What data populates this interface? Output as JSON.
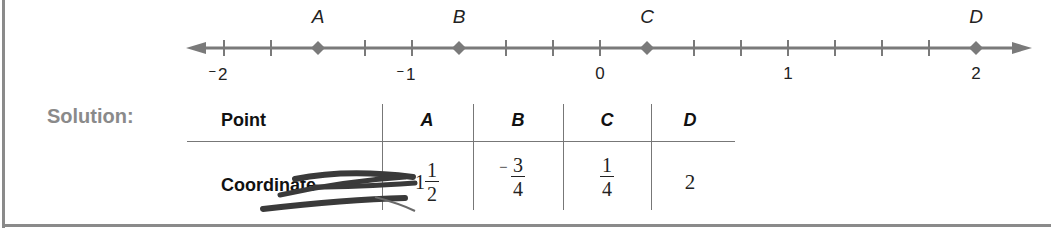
{
  "number_line": {
    "min": -2,
    "max": 2,
    "tick_step": 0.25,
    "major_labels": [
      {
        "value": -2,
        "sign": "−",
        "digit": "2"
      },
      {
        "value": -1,
        "sign": "−",
        "digit": "1"
      },
      {
        "value": 0,
        "sign": "",
        "digit": "0"
      },
      {
        "value": 1,
        "sign": "",
        "digit": "1"
      },
      {
        "value": 2,
        "sign": "",
        "digit": "2"
      }
    ],
    "points": [
      {
        "label": "A",
        "value": -1.5
      },
      {
        "label": "B",
        "value": -0.75
      },
      {
        "label": "C",
        "value": 0.25
      },
      {
        "label": "D",
        "value": 2
      }
    ],
    "color": "#7a7a7a"
  },
  "solution": {
    "heading": "Solution:",
    "table": {
      "row_header": "Point",
      "value_header": "Coordinate",
      "columns": [
        {
          "point": "A",
          "coordinate": {
            "sign": "",
            "whole": "1",
            "num": "1",
            "den": "2"
          },
          "note": "minus sign scribbled out"
        },
        {
          "point": "B",
          "coordinate": {
            "sign": "−",
            "whole": "",
            "num": "3",
            "den": "4"
          }
        },
        {
          "point": "C",
          "coordinate": {
            "sign": "",
            "whole": "",
            "num": "1",
            "den": "4"
          }
        },
        {
          "point": "D",
          "coordinate": {
            "sign": "",
            "whole": "2",
            "num": "",
            "den": ""
          }
        }
      ]
    }
  }
}
